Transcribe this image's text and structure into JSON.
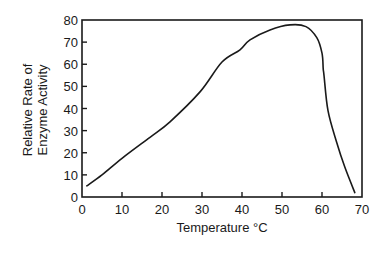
{
  "chart_data": {
    "type": "line",
    "title": "",
    "xlabel": "Temperature °C",
    "ylabel_lines": [
      "Relative Rate of",
      "Enzyme Activity"
    ],
    "ylabel": "Relative Rate of Enzyme Activity",
    "xlim": [
      0,
      70
    ],
    "ylim": [
      0,
      80
    ],
    "x_ticks": [
      0,
      10,
      20,
      30,
      40,
      50,
      60,
      70
    ],
    "y_ticks": [
      0,
      10,
      20,
      30,
      40,
      50,
      60,
      70,
      80
    ],
    "grid": false,
    "legend": null,
    "series": [
      {
        "name": "Enzyme activity",
        "color": "#1a1a1a",
        "x": [
          1.2,
          5,
          10,
          17,
          22,
          29.5,
          35,
          39.5,
          42,
          47,
          52,
          56,
          58.7,
          60,
          60.3,
          60.5,
          61.5,
          63.7,
          65.7,
          68.2
        ],
        "y": [
          5,
          10,
          17.5,
          27,
          34,
          47.5,
          61,
          66.5,
          71,
          75.5,
          77.8,
          77,
          72,
          65,
          58,
          55,
          39,
          24.5,
          13.5,
          2
        ]
      }
    ]
  }
}
